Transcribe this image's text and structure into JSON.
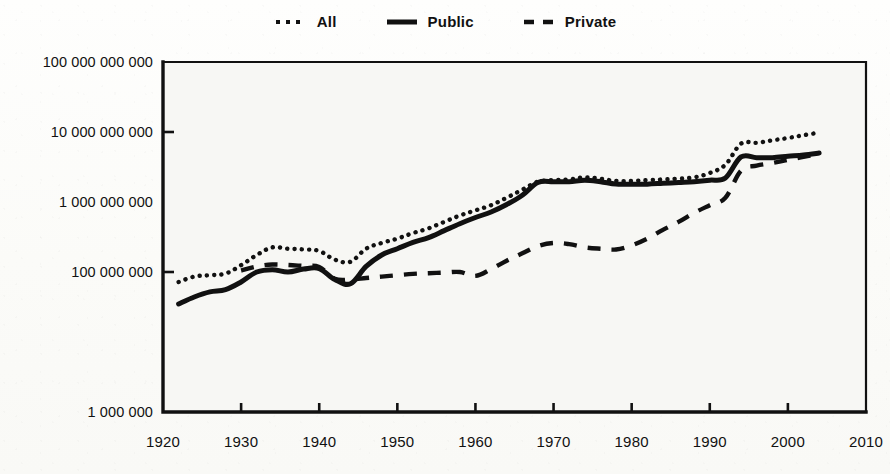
{
  "chart_data": {
    "type": "line",
    "title": "",
    "subtitle": "",
    "xlabel": "",
    "ylabel": "",
    "yscale": "log",
    "grid": false,
    "legend_position": "top-center",
    "xlim": [
      1920,
      2010
    ],
    "ylim": [
      1000000,
      100000000000
    ],
    "x_ticks": [
      1920,
      1930,
      1940,
      1950,
      1960,
      1970,
      1980,
      1990,
      2000,
      2010
    ],
    "x_tick_labels": [
      "1920",
      "1930",
      "1940",
      "1950",
      "1960",
      "1970",
      "1980",
      "1990",
      "2000",
      "2010"
    ],
    "y_ticks": [
      1000000,
      100000000,
      1000000000,
      10000000000,
      100000000000
    ],
    "y_tick_labels": [
      "1 000 000",
      "100 000 000",
      "1 000 000 000",
      "10 000 000 000",
      "100 000 000 000"
    ],
    "series": [
      {
        "name": "All",
        "style": "dotted",
        "x": [
          1922,
          1924,
          1926,
          1928,
          1930,
          1932,
          1934,
          1936,
          1938,
          1940,
          1942,
          1944,
          1946,
          1948,
          1950,
          1952,
          1954,
          1956,
          1958,
          1960,
          1962,
          1964,
          1966,
          1968,
          1970,
          1972,
          1974,
          1976,
          1978,
          1980,
          1982,
          1984,
          1986,
          1988,
          1990,
          1992,
          1994,
          1996,
          1998,
          2000,
          2002,
          2004
        ],
        "values": [
          72000000,
          86000000,
          90000000,
          95000000,
          125000000,
          175000000,
          225000000,
          215000000,
          210000000,
          200000000,
          150000000,
          140000000,
          215000000,
          260000000,
          300000000,
          360000000,
          420000000,
          520000000,
          640000000,
          760000000,
          900000000,
          1150000000,
          1500000000,
          1950000000,
          2050000000,
          2100000000,
          2250000000,
          2150000000,
          2000000000,
          2000000000,
          2050000000,
          2100000000,
          2150000000,
          2250000000,
          2600000000,
          3400000000,
          6800000000,
          7000000000,
          7600000000,
          8200000000,
          9000000000,
          9800000000
        ]
      },
      {
        "name": "Public",
        "style": "solid",
        "x": [
          1922,
          1924,
          1926,
          1928,
          1930,
          1932,
          1934,
          1936,
          1938,
          1940,
          1942,
          1944,
          1946,
          1948,
          1950,
          1952,
          1954,
          1956,
          1958,
          1960,
          1962,
          1964,
          1966,
          1968,
          1970,
          1972,
          1974,
          1976,
          1978,
          1980,
          1982,
          1984,
          1986,
          1988,
          1990,
          1992,
          1994,
          1996,
          1998,
          2000,
          2002,
          2004
        ],
        "values": [
          35000000,
          44000000,
          52000000,
          56000000,
          72000000,
          100000000,
          108000000,
          100000000,
          110000000,
          112000000,
          78000000,
          68000000,
          120000000,
          175000000,
          215000000,
          265000000,
          310000000,
          390000000,
          490000000,
          600000000,
          720000000,
          920000000,
          1250000000,
          1900000000,
          1950000000,
          1950000000,
          2050000000,
          1950000000,
          1800000000,
          1800000000,
          1800000000,
          1850000000,
          1900000000,
          1950000000,
          2050000000,
          2200000000,
          4400000000,
          4300000000,
          4300000000,
          4500000000,
          4700000000,
          5000000000
        ]
      },
      {
        "name": "Private",
        "style": "dashed",
        "x": [
          1930,
          1932,
          1934,
          1936,
          1938,
          1940,
          1942,
          1944,
          1946,
          1948,
          1950,
          1952,
          1954,
          1956,
          1958,
          1960,
          1962,
          1964,
          1966,
          1968,
          1970,
          1972,
          1974,
          1976,
          1978,
          1980,
          1982,
          1984,
          1986,
          1988,
          1990,
          1992,
          1994,
          1996,
          1998,
          2000,
          2002,
          2004
        ],
        "values": [
          105000000,
          120000000,
          128000000,
          126000000,
          122000000,
          118000000,
          80000000,
          78000000,
          82000000,
          86000000,
          90000000,
          94000000,
          96000000,
          98000000,
          100000000,
          88000000,
          110000000,
          145000000,
          185000000,
          235000000,
          260000000,
          250000000,
          225000000,
          215000000,
          210000000,
          240000000,
          300000000,
          400000000,
          520000000,
          700000000,
          900000000,
          1150000000,
          2800000000,
          3300000000,
          3600000000,
          4000000000,
          4400000000,
          4900000000
        ]
      }
    ]
  },
  "legend": {
    "items": [
      {
        "label": "All",
        "style": "dotted"
      },
      {
        "label": "Public",
        "style": "solid"
      },
      {
        "label": "Private",
        "style": "dashed"
      }
    ]
  },
  "axes": {
    "y_labels": [
      "100 000 000 000",
      "10 000 000 000",
      "1 000 000 000",
      "100 000 000",
      "1 000 000"
    ],
    "x_labels": [
      "1920",
      "1930",
      "1940",
      "1950",
      "1960",
      "1970",
      "1980",
      "1990",
      "2000",
      "2010"
    ]
  },
  "colors": {
    "ink": "#111111",
    "paper": "#fbfbf8",
    "plot_background": "#f7f7f4"
  }
}
